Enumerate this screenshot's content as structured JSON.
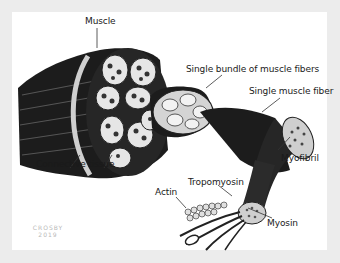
{
  "diagram": {
    "labels": {
      "muscle": "Muscle",
      "bundle": "Single bundle of muscle fibers",
      "fiber": "Single muscle fiber",
      "connective": "Connective tissue",
      "myofibril": "Myofibril",
      "tropomyosin": "Tropomyosin",
      "actin": "Actin",
      "myosin": "Myosin"
    },
    "signature": {
      "name": "CROSBY",
      "year": "2019"
    },
    "colors": {
      "background": "#ececec",
      "panel": "#ffffff",
      "muscle_dark": "#1c1c1c",
      "fascicle_light": "#d9d9d9",
      "label_text": "#1a1a1a"
    }
  }
}
